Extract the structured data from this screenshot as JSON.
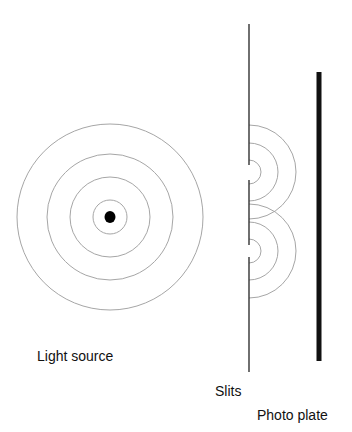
{
  "diagram": {
    "labels": {
      "light_source": "Light source",
      "slits": "Slits",
      "photo_plate": "Photo plate"
    },
    "colors": {
      "background": "#ffffff",
      "wave_line": "#a6a6a6",
      "barrier": "#222222",
      "plate": "#111111",
      "source_dot": "#000000",
      "text": "#111111"
    },
    "source": {
      "center": [
        110,
        217
      ],
      "dot_radius": 5.5,
      "wavefront_radii": [
        17,
        40,
        63,
        93
      ]
    },
    "barrier": {
      "x": 249,
      "y_top": 24,
      "y_bottom": 372,
      "slits": [
        {
          "center_y": 172,
          "gap": [
            165,
            180
          ]
        },
        {
          "center_y": 251,
          "gap": [
            245,
            257
          ]
        }
      ],
      "semicircle_radii": [
        12,
        29,
        47
      ]
    },
    "plate": {
      "x": 319,
      "width": 5,
      "y_top": 72,
      "y_bottom": 361
    }
  }
}
